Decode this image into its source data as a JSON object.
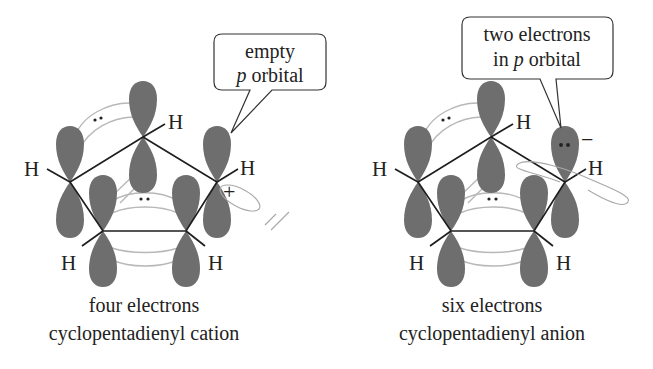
{
  "figure": {
    "colors": {
      "lobe": "#6e6e6e",
      "overlap_ring": "#b8b8b8",
      "bond": "#1e1e1e",
      "text": "#222222"
    }
  },
  "left_panel": {
    "callout": {
      "line1": "empty",
      "line2_italic": "p",
      "line2_rest": " orbital"
    },
    "atom_labels": [
      "H",
      "H",
      "H",
      "H",
      "H"
    ],
    "charge": "+",
    "caption": {
      "line1": "four electrons",
      "line2": "cyclopentadienyl cation"
    }
  },
  "right_panel": {
    "callout": {
      "line1": "two electrons",
      "line2_pre": "in ",
      "line2_italic": "p",
      "line2_rest": " orbital"
    },
    "atom_labels": [
      "H",
      "H",
      "H",
      "H",
      "H"
    ],
    "charge": "−",
    "caption": {
      "line1": "six electrons",
      "line2": "cyclopentadienyl anion"
    }
  }
}
